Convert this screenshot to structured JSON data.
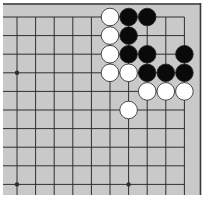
{
  "board": {
    "view": "top-right corner of a Go board",
    "colors": {
      "background": "#c9c9c9",
      "line": "#2f2f2f",
      "border": "#3a3a3a",
      "black_stone": "#0a0a0a",
      "white_stone": "#ffffff",
      "stone_outline": "#222222",
      "page": "#ffffff"
    },
    "grid": {
      "columns": 10,
      "rows": 10,
      "origin_x": 17,
      "origin_y": 17,
      "spacing": 18.6
    },
    "star_points": [
      {
        "col": 0,
        "row": 3
      },
      {
        "col": 0,
        "row": 9
      },
      {
        "col": 6,
        "row": 9
      }
    ],
    "stones": [
      {
        "color": "white",
        "col": 5,
        "row": 0
      },
      {
        "color": "black",
        "col": 6,
        "row": 0
      },
      {
        "color": "black",
        "col": 7,
        "row": 0
      },
      {
        "color": "white",
        "col": 5,
        "row": 1
      },
      {
        "color": "black",
        "col": 6,
        "row": 1
      },
      {
        "color": "white",
        "col": 5,
        "row": 2
      },
      {
        "color": "black",
        "col": 6,
        "row": 2
      },
      {
        "color": "black",
        "col": 7,
        "row": 2
      },
      {
        "color": "black",
        "col": 9,
        "row": 2
      },
      {
        "color": "white",
        "col": 5,
        "row": 3
      },
      {
        "color": "white",
        "col": 6,
        "row": 3
      },
      {
        "color": "black",
        "col": 7,
        "row": 3
      },
      {
        "color": "black",
        "col": 8,
        "row": 3
      },
      {
        "color": "black",
        "col": 9,
        "row": 3
      },
      {
        "color": "white",
        "col": 7,
        "row": 4
      },
      {
        "color": "white",
        "col": 8,
        "row": 4
      },
      {
        "color": "white",
        "col": 9,
        "row": 4
      },
      {
        "color": "white",
        "col": 6,
        "row": 5
      }
    ]
  }
}
